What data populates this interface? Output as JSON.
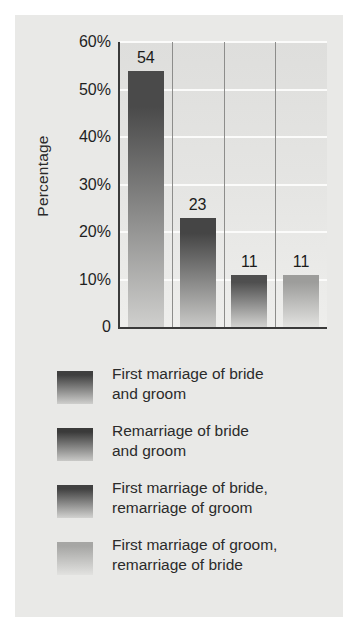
{
  "figure": {
    "background_color": "#e9e9e7",
    "page_background": "#ffffff"
  },
  "chart_data": {
    "type": "bar",
    "title": "",
    "xlabel": "",
    "ylabel": "Percentage",
    "categories": [
      "First marriage of bride and groom",
      "Remarriage of bride and groom",
      "First marriage of bride, remarriage of groom",
      "First marriage of groom, remarriage of bride"
    ],
    "values": [
      54,
      23,
      11,
      11
    ],
    "value_labels": [
      "54",
      "23",
      "11",
      "11"
    ],
    "ylim": [
      0,
      60
    ],
    "y_tick_labels": [
      "60%",
      "50%",
      "40%",
      "30%",
      "20%",
      "10%",
      "0"
    ],
    "y_tick_values": [
      60,
      50,
      40,
      30,
      20,
      10,
      0
    ],
    "grid": true,
    "gridline_color": "#fbfbfa",
    "legend_position": "below",
    "axis_color": "#3a3a3a",
    "bar_colors": [
      "#4a4a4a",
      "#454545",
      "#4f4f4f",
      "#9d9d9b"
    ]
  },
  "axis": {
    "y_title": "Percentage",
    "ticks": [
      {
        "label": "60%",
        "value": 60
      },
      {
        "label": "50%",
        "value": 50
      },
      {
        "label": "40%",
        "value": 40
      },
      {
        "label": "30%",
        "value": 30
      },
      {
        "label": "20%",
        "value": 20
      },
      {
        "label": "10%",
        "value": 10
      },
      {
        "label": "0",
        "value": 0
      }
    ]
  },
  "bars": [
    {
      "value": 54,
      "label": "54"
    },
    {
      "value": 23,
      "label": "23"
    },
    {
      "value": 11,
      "label": "11"
    },
    {
      "value": 11,
      "label": "11"
    }
  ],
  "legend": {
    "items": [
      {
        "line1": "First marriage of bride",
        "line2": "and groom",
        "swatch_top": "#3f3f3f",
        "swatch_bottom": "#cfcfcd"
      },
      {
        "line1": "Remarriage of bride",
        "line2": "and groom",
        "swatch_top": "#3a3a3a",
        "swatch_bottom": "#c9c9c7"
      },
      {
        "line1": "First marriage of bride,",
        "line2": "remarriage of groom",
        "swatch_top": "#414141",
        "swatch_bottom": "#d2d2d0"
      },
      {
        "line1": "First marriage of groom,",
        "line2": "remarriage of bride",
        "swatch_top": "#a6a6a4",
        "swatch_bottom": "#e2e2e0"
      }
    ]
  }
}
